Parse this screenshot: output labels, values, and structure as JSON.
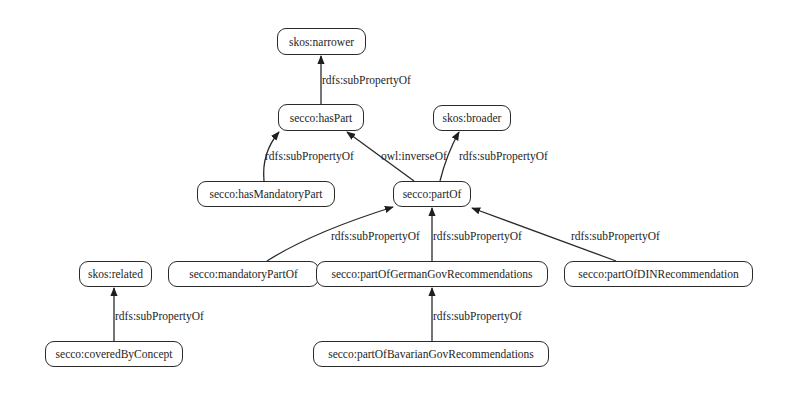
{
  "diagram": {
    "type": "ontology-property-hierarchy",
    "nodes": {
      "skos_narrower": "skos:narrower",
      "secco_hasPart": "secco:hasPart",
      "skos_broader": "skos:broader",
      "secco_hasMandatoryPart": "secco:hasMandatoryPart",
      "secco_partOf": "secco:partOf",
      "skos_related": "skos:related",
      "secco_mandatoryPartOf": "secco:mandatoryPartOf",
      "secco_partOfGermanGovRecommendations": "secco:partOfGermanGovRecommendations",
      "secco_partOfDINRecommendation": "secco:partOfDINRecommendation",
      "secco_coveredByConcept": "secco:coveredByConcept",
      "secco_partOfBavarianGovRecommendations": "secco:partOfBavarianGovRecommendations"
    },
    "edges": [
      {
        "from": "secco:hasPart",
        "to": "skos:narrower",
        "label": "rdfs:subPropertyOf"
      },
      {
        "from": "secco:hasMandatoryPart",
        "to": "secco:hasPart",
        "label": "rdfs:subPropertyOf"
      },
      {
        "from": "secco:partOf",
        "to": "secco:hasPart",
        "label": "owl:inverseOf"
      },
      {
        "from": "secco:partOf",
        "to": "skos:broader",
        "label": "rdfs:subPropertyOf"
      },
      {
        "from": "secco:mandatoryPartOf",
        "to": "secco:partOf",
        "label": "rdfs:subPropertyOf"
      },
      {
        "from": "secco:partOfGermanGovRecommendations",
        "to": "secco:partOf",
        "label": "rdfs:subPropertyOf"
      },
      {
        "from": "secco:partOfDINRecommendation",
        "to": "secco:partOf",
        "label": "rdfs:subPropertyOf"
      },
      {
        "from": "secco:coveredByConcept",
        "to": "skos:related",
        "label": "rdfs:subPropertyOf"
      },
      {
        "from": "secco:partOfBavarianGovRecommendations",
        "to": "secco:partOfGermanGovRecommendations",
        "label": "rdfs:subPropertyOf"
      }
    ],
    "edge_labels": {
      "e0": "rdfs:subPropertyOf",
      "e1": "rdfs:subPropertyOf",
      "e2": "owl:inverseOf",
      "e3": "rdfs:subPropertyOf",
      "e4": "rdfs:subPropertyOf",
      "e5": "rdfs:subPropertyOf",
      "e6": "rdfs:subPropertyOf",
      "e7": "rdfs:subPropertyOf",
      "e8": "rdfs:subPropertyOf"
    },
    "colors": {
      "background": "#ffffff",
      "stroke": "#2a2a2a",
      "text": "#1e1e1e"
    }
  }
}
